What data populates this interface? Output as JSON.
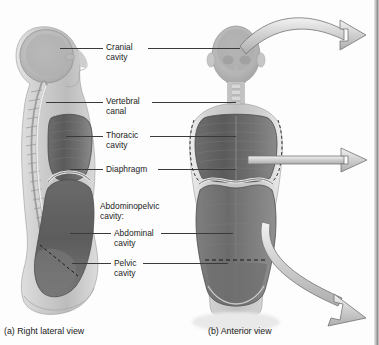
{
  "figure": {
    "background_color": "#fdfdfd",
    "label_color": "#1b1b1b",
    "leader_color": "#3a3a3a",
    "arrow_fill": "#d4d4d4",
    "arrow_stroke": "#6e6e6e"
  },
  "labels": {
    "cranial_cavity_line1": "Cranial",
    "cranial_cavity_line2": "cavity",
    "vertebral_canal_line1": "Vertebral",
    "vertebral_canal_line2": "canal",
    "thoracic_cavity_line1": "Thoracic",
    "thoracic_cavity_line2": "cavity",
    "diaphragm": "Diaphragm",
    "abdominopelvic_line1": "Abdominopelvic",
    "abdominopelvic_line2": "cavity:",
    "abdominal_cavity_line1": "Abdominal",
    "abdominal_cavity_line2": "cavity",
    "pelvic_cavity_line1": "Pelvic",
    "pelvic_cavity_line2": "cavity"
  },
  "captions": {
    "panel_a": "(a) Right lateral view",
    "panel_b": "(b) Anterior view"
  },
  "icons": {
    "arrow_top": "curved-arrow-right-icon",
    "arrow_middle": "straight-arrow-right-icon",
    "arrow_bottom": "curved-arrow-down-right-icon"
  }
}
